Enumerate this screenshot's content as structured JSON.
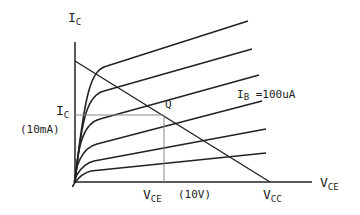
{
  "diagram": {
    "axes": {
      "y_label": {
        "main": "I",
        "sub": "C"
      },
      "x_label": {
        "main": "V",
        "sub": "CE"
      }
    },
    "curves": {
      "count": 6,
      "parameter": "I_B",
      "annotation": {
        "main": "I",
        "sub": "B",
        "rest": " =100uA"
      }
    },
    "load_line": {
      "end_label": {
        "main": "V",
        "sub": "CC"
      }
    },
    "q_point": {
      "label": "Q",
      "ic_label": {
        "main": "I",
        "sub": "C"
      },
      "ic_value": "(10mA)",
      "vce_label": {
        "main": "V",
        "sub": "CE"
      },
      "vce_value": "(10V)"
    },
    "colors": {
      "ink": "#222222",
      "guide": "#888888"
    }
  }
}
